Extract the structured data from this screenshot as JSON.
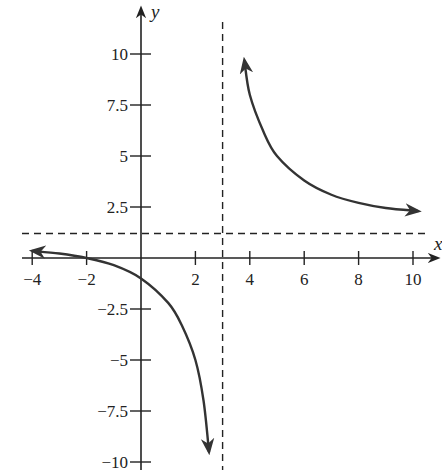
{
  "chart_data": {
    "type": "line",
    "title": "",
    "xlabel": "x",
    "ylabel": "y",
    "xlim": [
      -4.3,
      11.2
    ],
    "ylim": [
      -10.2,
      11.5
    ],
    "grid": false,
    "legend": null,
    "x_ticks": [
      -4,
      -2,
      2,
      4,
      6,
      8,
      10
    ],
    "x_tick_labels": [
      "−4",
      "−2",
      "2",
      "4",
      "6",
      "8",
      "10"
    ],
    "y_ticks": [
      10,
      7.5,
      5,
      2.5,
      -2.5,
      -5,
      -7.5,
      -10
    ],
    "y_tick_labels": [
      "10",
      "7.5",
      "5",
      "2.5",
      "−2.5",
      "−5",
      "−7.5",
      "−10"
    ],
    "asymptotes": {
      "vertical": {
        "x": 3,
        "style": "dashed"
      },
      "horizontal": {
        "y": 1.2,
        "style": "dashed"
      }
    },
    "series": [
      {
        "name": "left branch",
        "arrows": "both",
        "points": [
          [
            -4,
            0.35
          ],
          [
            -3,
            0.22
          ],
          [
            -2,
            0
          ],
          [
            -1,
            -0.35
          ],
          [
            0,
            -1.0
          ],
          [
            1,
            -2.2
          ],
          [
            1.5,
            -3.3
          ],
          [
            2,
            -5.0
          ],
          [
            2.3,
            -7.0
          ],
          [
            2.5,
            -9.5
          ]
        ]
      },
      {
        "name": "right branch",
        "arrows": "both",
        "points": [
          [
            3.8,
            9.7
          ],
          [
            4,
            8.0
          ],
          [
            4.5,
            6.2
          ],
          [
            5,
            5.0
          ],
          [
            6,
            3.8
          ],
          [
            7,
            3.1
          ],
          [
            8,
            2.7
          ],
          [
            9,
            2.45
          ],
          [
            10.2,
            2.3
          ]
        ]
      }
    ]
  },
  "colors": {
    "axis": "#222222",
    "curve": "#333333",
    "dash": "#222222"
  }
}
